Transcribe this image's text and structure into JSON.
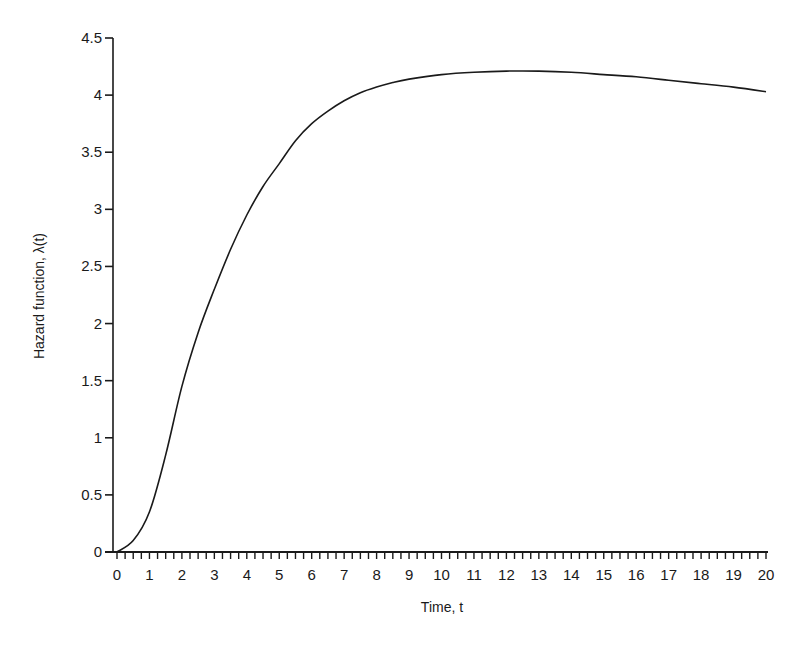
{
  "chart_data": {
    "type": "line",
    "title": "",
    "xlabel": "Time, t",
    "ylabel": "Hazard function, λ(t)",
    "xlim": [
      0,
      20
    ],
    "ylim": [
      0,
      4.5
    ],
    "grid": false,
    "legend": null,
    "x_ticks": [
      0,
      1,
      2,
      3,
      4,
      5,
      6,
      7,
      8,
      9,
      10,
      11,
      12,
      13,
      14,
      15,
      16,
      17,
      18,
      19,
      20
    ],
    "x_tick_labels": [
      "0",
      "1",
      "2",
      "3",
      "4",
      "5",
      "6",
      "7",
      "8",
      "9",
      "10",
      "11",
      "12",
      "13",
      "14",
      "15",
      "16",
      "17",
      "18",
      "19",
      "20"
    ],
    "x_minor_tick_step": 0.25,
    "y_ticks": [
      0,
      0.5,
      1,
      1.5,
      2,
      2.5,
      3,
      3.5,
      4,
      4.5
    ],
    "y_tick_labels": [
      "0",
      "0.5",
      "1",
      "1.5",
      "2",
      "2.5",
      "3",
      "3.5",
      "4",
      "4.5"
    ],
    "series": [
      {
        "name": "λ(t)",
        "color": "#1a1a1a",
        "x": [
          0,
          0.5,
          1,
          1.5,
          2,
          2.5,
          3,
          3.5,
          4,
          4.5,
          5,
          5.5,
          6,
          6.5,
          7,
          7.5,
          8,
          8.5,
          9,
          10,
          11,
          12,
          13,
          14,
          15,
          16,
          17,
          18,
          19,
          20
        ],
        "y": [
          0,
          0.1,
          0.35,
          0.85,
          1.45,
          1.92,
          2.3,
          2.65,
          2.95,
          3.2,
          3.4,
          3.6,
          3.75,
          3.86,
          3.95,
          4.02,
          4.07,
          4.11,
          4.14,
          4.18,
          4.2,
          4.21,
          4.21,
          4.2,
          4.18,
          4.16,
          4.13,
          4.1,
          4.07,
          4.03
        ]
      }
    ]
  }
}
